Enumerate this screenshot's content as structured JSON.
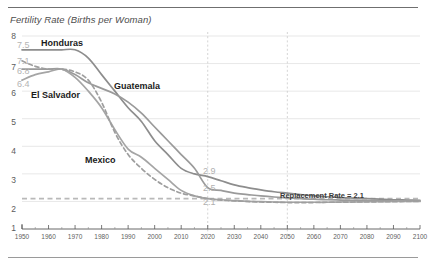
{
  "chart_data": {
    "type": "line",
    "title": "Fertility Rate (Births per Woman)",
    "xlabel": "",
    "ylabel": "Fertility Rate (Births per Woman)",
    "xlim": [
      1950,
      2100
    ],
    "ylim": [
      1,
      8
    ],
    "grid": true,
    "legend_position": "inline-labels",
    "x_ticks": [
      1950,
      1960,
      1970,
      1980,
      1990,
      2000,
      2010,
      2020,
      2030,
      2040,
      2050,
      2060,
      2070,
      2080,
      2090,
      2100
    ],
    "y_ticks": [
      1,
      2,
      3,
      4,
      5,
      6,
      7,
      8
    ],
    "y_value_labels": [
      "7.5",
      "7.1",
      "6.8",
      "6.4"
    ],
    "vertical_markers": [
      2020,
      2050
    ],
    "reference_line": {
      "label": "Replacement Rate = 2.1",
      "value": 2.1
    },
    "x": [
      1950,
      1955,
      1960,
      1965,
      1970,
      1975,
      1980,
      1985,
      1990,
      1995,
      2000,
      2005,
      2010,
      2015,
      2020,
      2025,
      2030,
      2035,
      2040,
      2045,
      2050,
      2055,
      2060,
      2065,
      2070,
      2075,
      2080,
      2085,
      2090,
      2095,
      2100
    ],
    "series": [
      {
        "name": "Honduras",
        "start_value": 7.5,
        "value_2020": 2.9,
        "style": "solid",
        "color": "#8d8d8d",
        "values": [
          7.5,
          7.5,
          7.5,
          7.5,
          7.5,
          7.2,
          6.6,
          6.0,
          5.4,
          4.9,
          4.2,
          3.7,
          3.2,
          3.0,
          2.9,
          2.75,
          2.6,
          2.5,
          2.42,
          2.35,
          2.3,
          2.25,
          2.2,
          2.17,
          2.14,
          2.12,
          2.1,
          2.08,
          2.06,
          2.05,
          2.04
        ]
      },
      {
        "name": "Guatemala",
        "start_value": 6.8,
        "value_2020": 2.5,
        "style": "solid",
        "color": "#9a9a9a",
        "values": [
          6.8,
          6.8,
          6.8,
          6.8,
          6.6,
          6.3,
          6.1,
          5.9,
          5.6,
          5.2,
          4.7,
          4.2,
          3.7,
          3.2,
          2.5,
          2.4,
          2.3,
          2.25,
          2.2,
          2.16,
          2.13,
          2.1,
          2.08,
          2.06,
          2.05,
          2.04,
          2.03,
          2.02,
          2.02,
          2.01,
          2.01
        ]
      },
      {
        "name": "El Salvador",
        "start_value": 6.4,
        "value_2020": 2.1,
        "style": "solid",
        "color": "#a5a5a5",
        "values": [
          6.4,
          6.6,
          6.7,
          6.8,
          6.5,
          6.0,
          5.4,
          4.6,
          3.9,
          3.6,
          3.2,
          2.8,
          2.4,
          2.2,
          2.1,
          2.06,
          2.03,
          2.0,
          1.99,
          1.98,
          1.97,
          1.97,
          1.97,
          1.97,
          1.98,
          1.98,
          1.99,
          1.99,
          2.0,
          2.0,
          2.0
        ]
      },
      {
        "name": "Mexico",
        "start_value": 7.1,
        "value_2020": 2.1,
        "style": "dashed",
        "color": "#9e9e9e",
        "values": [
          7.1,
          6.9,
          6.8,
          6.8,
          6.7,
          6.4,
          5.6,
          4.5,
          3.7,
          3.2,
          2.8,
          2.5,
          2.3,
          2.2,
          2.1,
          2.05,
          2.02,
          2.0,
          1.98,
          1.97,
          1.96,
          1.96,
          1.96,
          1.97,
          1.97,
          1.98,
          1.98,
          1.99,
          1.99,
          2.0,
          2.0
        ]
      }
    ]
  },
  "labels": {
    "honduras": "Honduras",
    "guatemala": "Guatemala",
    "el_salvador": "El Salvador",
    "mexico": "Mexico",
    "replacement": "Replacement Rate = 2.1",
    "end_2_9": "2.9",
    "end_2_5": "2.5",
    "end_2_1": "2.1"
  },
  "axis": {
    "y_major": [
      "8",
      "7",
      "6",
      "5",
      "4",
      "3",
      "2",
      "1"
    ],
    "y_values": [
      "7.5",
      "7.1",
      "6.8",
      "6.4"
    ],
    "x": [
      "1950",
      "1960",
      "1970",
      "1980",
      "1990",
      "2000",
      "2010",
      "2020",
      "2030",
      "2040",
      "2050",
      "2060",
      "2070",
      "2080",
      "2090",
      "2100"
    ]
  },
  "colors": {
    "rule": "#6f6f6f",
    "grid": "#dcdcdc",
    "marker": "#c9c9c9",
    "text": "#4d4d4d",
    "value_label": "#b4b4b4"
  }
}
